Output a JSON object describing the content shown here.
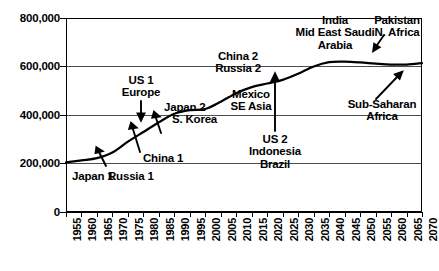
{
  "chart_data": {
    "type": "line",
    "title": "",
    "xlabel": "",
    "ylabel": "",
    "xlim": [
      1955,
      2070
    ],
    "ylim": [
      0,
      800000
    ],
    "grid": true,
    "legend": "none",
    "y_ticks": [
      "0",
      "200,000",
      "400,000",
      "600,000",
      "800,000"
    ],
    "y_tick_values": [
      0,
      200000,
      400000,
      600000,
      800000
    ],
    "x_ticks": [
      "1955",
      "1960",
      "1965",
      "1970",
      "1975",
      "1980",
      "1985",
      "1990",
      "1995",
      "2000",
      "2005",
      "2010",
      "2015",
      "2020",
      "2025",
      "2030",
      "2035",
      "2040",
      "2045",
      "2050",
      "2055",
      "2060",
      "2065",
      "2070"
    ],
    "x": [
      1955,
      1960,
      1965,
      1970,
      1975,
      1980,
      1985,
      1990,
      1995,
      2000,
      2005,
      2010,
      2015,
      2020,
      2025,
      2030,
      2035,
      2040,
      2045,
      2050,
      2055,
      2060,
      2065,
      2070
    ],
    "values": [
      205000,
      213000,
      222000,
      245000,
      290000,
      330000,
      370000,
      405000,
      420000,
      425000,
      455000,
      490000,
      515000,
      530000,
      545000,
      570000,
      600000,
      618000,
      620000,
      617000,
      612000,
      608000,
      608000,
      614000
    ],
    "series": [
      {
        "name": "cumulative adoption",
        "values": [
          205000,
          213000,
          222000,
          245000,
          290000,
          330000,
          370000,
          405000,
          420000,
          425000,
          455000,
          490000,
          515000,
          530000,
          545000,
          570000,
          600000,
          618000,
          620000,
          617000,
          612000,
          608000,
          608000,
          614000
        ]
      }
    ],
    "annotations": [
      {
        "id": "japan-1",
        "text": "Japan 1",
        "x": 1960,
        "y": 185000,
        "arrow": false
      },
      {
        "id": "russia-1",
        "text": "Russia 1",
        "x": 1972,
        "y": 250000,
        "arrow": true
      },
      {
        "id": "china-1",
        "text": "China 1",
        "x": 1983,
        "y": 290000,
        "arrow": true
      },
      {
        "id": "us-1-europe",
        "text": "US 1\nEurope",
        "x": 1983,
        "y": 450000,
        "arrow": true
      },
      {
        "id": "japan-2-korea",
        "text": "Japan 2\nS. Korea",
        "x": 1993,
        "y": 400000,
        "arrow": true
      },
      {
        "id": "china-2-russia-2",
        "text": "China 2\nRussia 2",
        "x": 2011,
        "y": 650000,
        "arrow": false
      },
      {
        "id": "mexico-se-asia",
        "text": "Mexico\nSE Asia",
        "x": 2019,
        "y": 480000,
        "arrow": false
      },
      {
        "id": "us-2-indonesia-brazil",
        "text": "US 2\nIndonesia\nBrazil",
        "x": 2032,
        "y": 300000,
        "arrow": true
      },
      {
        "id": "india-mideast-saudi",
        "text": "India\nMid East Saudi\nArabia",
        "x": 2044,
        "y": 760000,
        "arrow": false
      },
      {
        "id": "pakistan-n-africa",
        "text": "Pakistan\nN. Africa",
        "x": 2063,
        "y": 760000,
        "arrow": true
      },
      {
        "id": "sub-saharan-africa",
        "text": "Sub-Saharan\nAfrica",
        "x": 2062,
        "y": 490000,
        "arrow": true
      }
    ]
  },
  "annotation_labels": {
    "japan_1": "Japan 1",
    "russia_1": "Russia 1",
    "china_1": "China 1",
    "us_1": "US 1",
    "europe": "Europe",
    "japan_2": "Japan 2",
    "s_korea": "S. Korea",
    "china_2": "China 2",
    "russia_2": "Russia 2",
    "mexico": "Mexico",
    "se_asia": "SE Asia",
    "us_2": "US 2",
    "indonesia": "Indonesia",
    "brazil": "Brazil",
    "india": "India",
    "mid_east_saudi": "Mid East Saudi",
    "arabia": "Arabia",
    "pakistan": "Pakistan",
    "n_africa": "N. Africa",
    "sub_saharan": "Sub-Saharan",
    "africa": "Africa"
  },
  "axis": {
    "y_labels": [
      "800,000",
      "600,000",
      "400,000",
      "200,000",
      "0"
    ],
    "x_labels": [
      "1955",
      "1960",
      "1965",
      "1970",
      "1975",
      "1980",
      "1985",
      "1990",
      "1995",
      "2000",
      "2005",
      "2010",
      "2015",
      "2020",
      "2025",
      "2030",
      "2035",
      "2040",
      "2045",
      "2050",
      "2055",
      "2060",
      "2065",
      "2070"
    ]
  },
  "colors": {
    "curve": "#000000",
    "grid": "#4d4d4d",
    "axis": "#000000",
    "background": "#ffffff"
  }
}
